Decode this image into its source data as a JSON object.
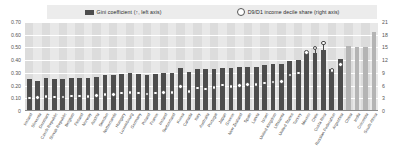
{
  "legend": {
    "series1": {
      "label": "Gini coefficient (↑, left axis)",
      "color": "#4d4d4d",
      "icon": "square-swatch"
    },
    "series2": {
      "label": "D9/D1 income decile share (right axis)",
      "color": "#ffffff",
      "icon": "circle-marker"
    }
  },
  "axes": {
    "left_ticks": [
      "0.70",
      "0.60",
      "0.50",
      "0.40",
      "0.30",
      "0.20",
      "0.10",
      "0"
    ],
    "right_ticks": [
      "21",
      "18",
      "15",
      "12",
      "9",
      "6",
      "3",
      "0"
    ]
  },
  "chart_data": {
    "type": "bar",
    "title": "",
    "xlabel": "",
    "ylabel": "Gini coefficient",
    "y2label": "D9/D1 income decile share",
    "ylim": [
      0,
      0.7
    ],
    "y2lim": [
      0,
      21
    ],
    "grid": true,
    "legend_position": "top",
    "categories": [
      "Iceland",
      "Slovenia",
      "Denmark",
      "Czech Republic",
      "Slovak Republic",
      "Belgium",
      "Finland",
      "Norway",
      "Austria",
      "Sweden",
      "Netherlands",
      "Hungary",
      "Luxembourg",
      "Germany",
      "Poland",
      "France",
      "Ireland",
      "Switzerland",
      "Korea",
      "Canada",
      "Italy",
      "Australia",
      "Portugal",
      "Japan",
      "Greece",
      "New Zealand",
      "Spain",
      "Latvia",
      "Israel",
      "United Kingdom",
      "Lithuania",
      "United States",
      "Turkey",
      "Mexico",
      "Chile",
      "Costa Rica",
      "Russian Federation",
      "Argentina",
      "China",
      "India",
      "Colombia",
      "South Africa"
    ],
    "series": [
      {
        "name": "Gini coefficient (↑, left axis)",
        "axis": "left",
        "color": "#4d4d4d",
        "highlight_color": "#b4b4b4",
        "highlight_from_index": 38,
        "values": [
          0.25,
          0.24,
          0.26,
          0.25,
          0.25,
          0.26,
          0.26,
          0.26,
          0.27,
          0.28,
          0.28,
          0.29,
          0.3,
          0.29,
          0.28,
          0.29,
          0.3,
          0.3,
          0.34,
          0.31,
          0.33,
          0.33,
          0.33,
          0.34,
          0.34,
          0.35,
          0.35,
          0.35,
          0.36,
          0.37,
          0.37,
          0.39,
          0.4,
          0.46,
          0.46,
          0.48,
          0.33,
          0.41,
          0.51,
          0.5,
          0.5,
          0.62
        ]
      },
      {
        "name": "D9/D1 income decile share (right axis)",
        "axis": "right",
        "color": "#ffffff",
        "values": [
          3.1,
          3.2,
          3.4,
          3.3,
          3.3,
          3.5,
          3.5,
          3.4,
          3.7,
          3.9,
          3.9,
          4.2,
          4.4,
          4.2,
          4.0,
          4.2,
          4.4,
          4.3,
          5.8,
          4.6,
          5.4,
          5.2,
          5.5,
          6.1,
          5.8,
          6.0,
          6.2,
          6.3,
          6.6,
          6.8,
          7.0,
          8.5,
          9.0,
          13.8,
          14.9,
          16.0,
          9.5,
          11.0,
          null,
          null,
          null,
          null
        ]
      }
    ]
  }
}
